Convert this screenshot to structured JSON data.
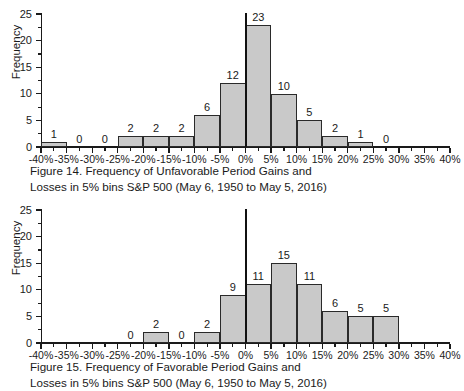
{
  "chart_data": [
    {
      "id": "figure-14",
      "type": "bar",
      "title": "",
      "xlabel": "",
      "ylabel": "Frequency",
      "ylim": [
        0,
        25
      ],
      "yticks": [
        0,
        5,
        10,
        15,
        20,
        25
      ],
      "xlim": [
        -40,
        40
      ],
      "xticks": [
        "-40%",
        "-35%",
        "-30%",
        "-25%",
        "-20%",
        "-15%",
        "-10%",
        "-5%",
        "0%",
        "5%",
        "10%",
        "15%",
        "20%",
        "25%",
        "30%",
        "35%",
        "40%"
      ],
      "bin_width": 5,
      "grid": false,
      "legend": "none",
      "annotations": [
        "vertical reference line at 0%"
      ],
      "bins": [
        {
          "range": "-40% to -35%",
          "start": -40,
          "value": 1,
          "label": "1"
        },
        {
          "range": "-35% to -30%",
          "start": -35,
          "value": 0,
          "label": "0"
        },
        {
          "range": "-30% to -25%",
          "start": -30,
          "value": 0,
          "label": "0"
        },
        {
          "range": "-25% to -20%",
          "start": -25,
          "value": 2,
          "label": "2"
        },
        {
          "range": "-20% to -15%",
          "start": -20,
          "value": 2,
          "label": "2"
        },
        {
          "range": "-15% to -10%",
          "start": -15,
          "value": 2,
          "label": "2"
        },
        {
          "range": "-10% to -5%",
          "start": -10,
          "value": 6,
          "label": "6"
        },
        {
          "range": "-5% to 0%",
          "start": -5,
          "value": 12,
          "label": "12"
        },
        {
          "range": "0% to 5%",
          "start": 0,
          "value": 23,
          "label": "23"
        },
        {
          "range": "5% to 10%",
          "start": 5,
          "value": 10,
          "label": "10"
        },
        {
          "range": "10% to 15%",
          "start": 10,
          "value": 5,
          "label": "5"
        },
        {
          "range": "15% to 20%",
          "start": 15,
          "value": 2,
          "label": "2"
        },
        {
          "range": "20% to 25%",
          "start": 20,
          "value": 1,
          "label": "1"
        },
        {
          "range": "25% to 30%",
          "start": 25,
          "value": 0,
          "label": "0"
        }
      ],
      "caption_line1": "Figure 14. Frequency of Unfavorable Period Gains and",
      "caption_line2": "Losses in 5% bins S&P 500 (May 6, 1950 to May 5, 2016)"
    },
    {
      "id": "figure-15",
      "type": "bar",
      "title": "",
      "xlabel": "",
      "ylabel": "Frequency",
      "ylim": [
        0,
        25
      ],
      "yticks": [
        0,
        5,
        10,
        15,
        20,
        25
      ],
      "xlim": [
        -40,
        40
      ],
      "xticks": [
        "-40%",
        "-35%",
        "-30%",
        "-25%",
        "-20%",
        "-15%",
        "-10%",
        "-5%",
        "0%",
        "5%",
        "10%",
        "15%",
        "20%",
        "25%",
        "30%",
        "35%",
        "40%"
      ],
      "bin_width": 5,
      "grid": false,
      "legend": "none",
      "annotations": [
        "vertical reference line at 0%"
      ],
      "bins": [
        {
          "range": "-25% to -20%",
          "start": -25,
          "value": 0,
          "label": "0"
        },
        {
          "range": "-20% to -15%",
          "start": -20,
          "value": 2,
          "label": "2"
        },
        {
          "range": "-15% to -10%",
          "start": -15,
          "value": 0,
          "label": "0"
        },
        {
          "range": "-10% to -5%",
          "start": -10,
          "value": 2,
          "label": "2"
        },
        {
          "range": "-5% to 0%",
          "start": -5,
          "value": 9,
          "label": "9"
        },
        {
          "range": "0% to 5%",
          "start": 0,
          "value": 11,
          "label": "11"
        },
        {
          "range": "5% to 10%",
          "start": 5,
          "value": 15,
          "label": "15"
        },
        {
          "range": "10% to 15%",
          "start": 10,
          "value": 11,
          "label": "11"
        },
        {
          "range": "15% to 20%",
          "start": 15,
          "value": 6,
          "label": "6"
        },
        {
          "range": "20% to 25%",
          "start": 20,
          "value": 5,
          "label": "5"
        },
        {
          "range": "25% to 30%",
          "start": 25,
          "value": 5,
          "label": "5"
        }
      ],
      "caption_line1": "Figure 15. Frequency of Favorable Period Gains and",
      "caption_line2": "Losses in 5% bins S&P 500 (May 6, 1950 to May 5, 2016)"
    }
  ],
  "colors": {
    "bar_fill": "#c9c9c9",
    "bar_stroke": "#2a2a2a",
    "axis": "#1a1a1a",
    "zero_line": "#111111",
    "background": "#ffffff"
  }
}
